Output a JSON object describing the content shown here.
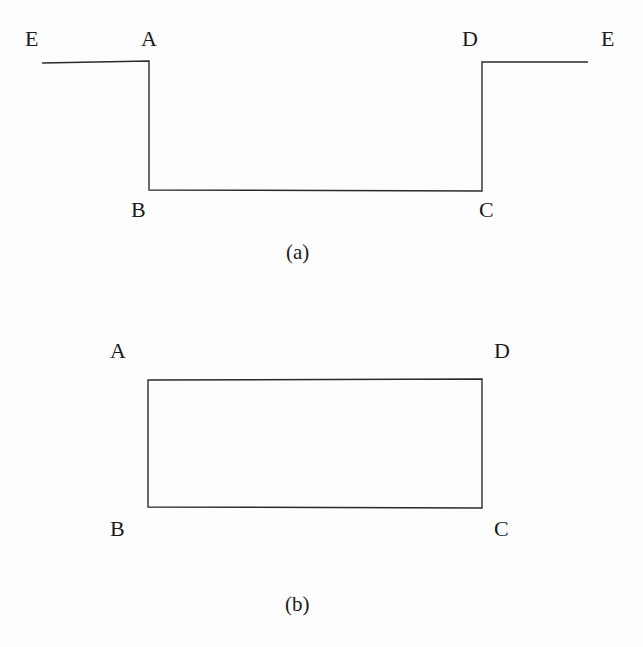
{
  "figure": {
    "background_color": "#fdfdfd",
    "line_color": "#2b2b2b",
    "text_color": "#1b1b1b",
    "line_width": 1.4
  },
  "panels": [
    {
      "id": "a",
      "caption": "(a)",
      "description": "square-well / rectangular notch profile",
      "labels": [
        {
          "key": "E-left",
          "text": "E"
        },
        {
          "key": "A",
          "text": "A"
        },
        {
          "key": "D",
          "text": "D"
        },
        {
          "key": "E-right",
          "text": "E"
        },
        {
          "key": "B",
          "text": "B"
        },
        {
          "key": "C",
          "text": "C"
        }
      ]
    },
    {
      "id": "b",
      "caption": "(b)",
      "description": "rectangle with corners labelled A D B C",
      "labels": [
        {
          "key": "A",
          "text": "A"
        },
        {
          "key": "D",
          "text": "D"
        },
        {
          "key": "B",
          "text": "B"
        },
        {
          "key": "C",
          "text": "C"
        }
      ]
    }
  ],
  "chart_data": {
    "type": "line",
    "title": "",
    "xlabel": "",
    "ylabel": "",
    "grid": false,
    "legend": false,
    "panels": [
      {
        "name": "(a)",
        "type": "line",
        "comment": "Step-well profile E-A-B-C-D-E drawn in pixel coordinates",
        "x": [
          42,
          149,
          149,
          482,
          482,
          588
        ],
        "y": [
          63,
          61,
          190,
          191,
          62,
          62
        ],
        "points": [
          {
            "label": "E",
            "x": 42,
            "y": 63
          },
          {
            "label": "A",
            "x": 149,
            "y": 61
          },
          {
            "label": "B",
            "x": 149,
            "y": 190
          },
          {
            "label": "C",
            "x": 482,
            "y": 191
          },
          {
            "label": "D",
            "x": 482,
            "y": 62
          },
          {
            "label": "E",
            "x": 588,
            "y": 62
          }
        ]
      },
      {
        "name": "(b)",
        "type": "line",
        "comment": "Closed rectangle A-D-C-B in pixel coordinates",
        "x": [
          148,
          482,
          482,
          148,
          148
        ],
        "y": [
          380,
          379,
          508,
          507,
          380
        ],
        "points": [
          {
            "label": "A",
            "x": 148,
            "y": 380
          },
          {
            "label": "D",
            "x": 482,
            "y": 379
          },
          {
            "label": "C",
            "x": 482,
            "y": 508
          },
          {
            "label": "B",
            "x": 148,
            "y": 507
          }
        ]
      }
    ]
  }
}
